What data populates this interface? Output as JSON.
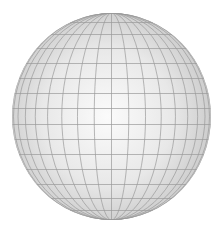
{
  "image": {
    "subject": "wireframe-sphere",
    "width": 219,
    "height": 233,
    "background": "#ffffff"
  },
  "sphere": {
    "cx": 111.5,
    "cy": 116.5,
    "rx": 99.5,
    "ry": 103.5,
    "fill_center": "#fbfbfb",
    "fill_mid": "#e8e8e8",
    "fill_edge": "#c9c9c9",
    "highlight_cx_pct": 48,
    "highlight_cy_pct": 50
  },
  "grid": {
    "line_color": "#9a9a9a",
    "line_width": 0.7,
    "meridian_step_deg": 10,
    "meridian_count_each_side": 9,
    "parallel_offsets_px": [
      -94,
      -82,
      -68,
      -53,
      -38,
      -23,
      -8,
      8,
      23,
      38,
      53,
      68,
      82,
      94
    ]
  }
}
